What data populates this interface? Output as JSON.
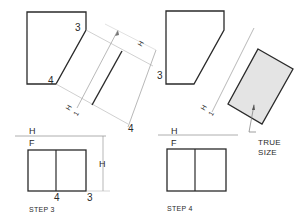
{
  "figure": {
    "colors": {
      "line": "#2a2a2a",
      "thin": "#9a9a9a",
      "shade": "#e4e4e4"
    },
    "step3": {
      "caption": "STEP 3",
      "top_view_labels": {
        "point3": "3",
        "point4": "4"
      },
      "aux_labels": {
        "dim_H": "H",
        "ref_H": "H",
        "ref_1": "1",
        "point3": "3",
        "point4": "4"
      },
      "fold_line": {
        "upper": "H",
        "lower": "F"
      },
      "front_view_labels": {
        "point4": "4",
        "point3": "3",
        "dim_H": "H"
      }
    },
    "step4": {
      "caption": "STEP 4",
      "aux_labels": {
        "ref_H": "H",
        "ref_1": "1"
      },
      "fold_line": {
        "upper": "H",
        "lower": "F"
      },
      "annotation": {
        "line1": "TRUE",
        "line2": "SIZE"
      }
    }
  }
}
